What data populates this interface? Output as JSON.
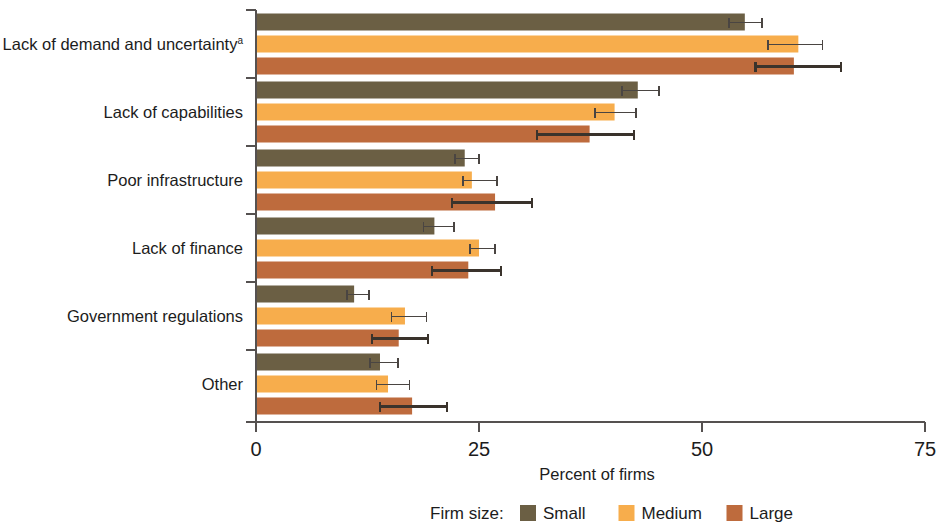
{
  "chart_data": {
    "type": "bar",
    "orientation": "horizontal",
    "title": "",
    "xlabel": "Percent of firms",
    "ylabel": "",
    "xlim": [
      0,
      75
    ],
    "xticks": [
      0,
      25,
      50,
      75
    ],
    "xtick_labels": [
      "0",
      "25",
      "50",
      "75"
    ],
    "grid": false,
    "legend_position": "bottom",
    "legend_title": "Firm size:",
    "error_bars": true,
    "footnote_marker": "a",
    "categories": [
      "Lack of demand and uncertainty",
      "Lack of capabilities",
      "Poor infrastructure",
      "Lack of finance",
      "Government regulations",
      "Other"
    ],
    "category_superscripts": [
      "a",
      "",
      "",
      "",
      "",
      ""
    ],
    "series": [
      {
        "name": "Small",
        "color": "#6b5f44",
        "values": [
          54.8,
          42.8,
          23.4,
          20.0,
          11.0,
          13.9
        ],
        "err_low": [
          53.0,
          41.0,
          22.3,
          18.8,
          10.2,
          12.8
        ],
        "err_high": [
          56.7,
          45.2,
          25.0,
          22.2,
          12.7,
          15.9
        ]
      },
      {
        "name": "Medium",
        "color": "#f7ad4c",
        "values": [
          60.8,
          40.2,
          24.2,
          25.0,
          16.7,
          14.8
        ],
        "err_low": [
          57.4,
          38.0,
          23.2,
          24.0,
          15.2,
          13.5
        ],
        "err_high": [
          63.5,
          42.6,
          27.0,
          26.8,
          19.1,
          17.2
        ]
      },
      {
        "name": "Large",
        "color": "#be6b3d",
        "values": [
          60.3,
          37.4,
          26.8,
          23.8,
          16.0,
          17.5
        ],
        "err_low": [
          56.0,
          31.5,
          22.0,
          19.7,
          13.0,
          13.9
        ],
        "err_high": [
          65.6,
          42.4,
          30.9,
          27.5,
          19.3,
          21.4
        ]
      }
    ]
  },
  "axis": {
    "x_title": "Percent of firms"
  },
  "legend": {
    "title": "Firm size:",
    "items": [
      {
        "label": "Small",
        "color": "#6b5f44"
      },
      {
        "label": "Medium",
        "color": "#f7ad4c"
      },
      {
        "label": "Large",
        "color": "#be6b3d"
      }
    ]
  }
}
